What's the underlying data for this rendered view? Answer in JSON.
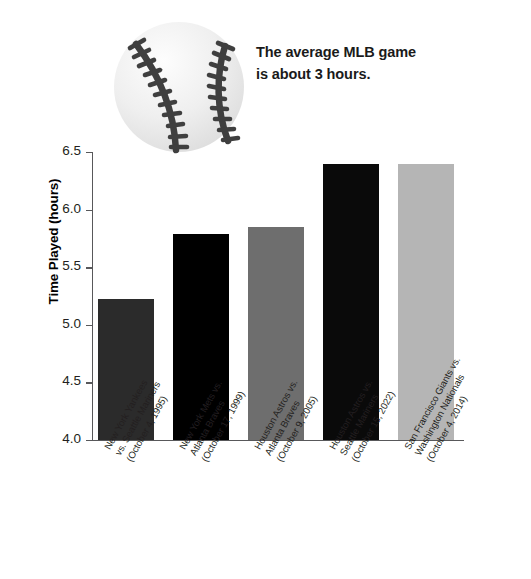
{
  "annotation": {
    "line1": "The average MLB game",
    "line2": "is about 3 hours."
  },
  "axes": {
    "y_title": "Time Played (hours)",
    "y_ticks": [
      "6.5",
      "6.0",
      "5.5",
      "5.0",
      "4.5",
      "4.0"
    ]
  },
  "icons": {
    "baseball": "baseball-icon"
  },
  "colors": {
    "bar1": "#2b2b2b",
    "bar2": "#000000",
    "bar3": "#6e6e6e",
    "bar4": "#0a0a0a",
    "bar5": "#b5b5b5",
    "axis": "#58585a",
    "baseball_body": "#ededed",
    "baseball_stitch": "#3f3f3f",
    "background": "#ffffff"
  },
  "chart_data": {
    "type": "bar",
    "title": "",
    "subtitle": "",
    "xlabel": "",
    "ylabel": "Time Played (hours)",
    "ylim": [
      4.0,
      6.5
    ],
    "ytick_step": 0.5,
    "grid": false,
    "legend": null,
    "annotations": [
      {
        "text": "The average MLB game is about 3 hours.",
        "position": "top-right"
      }
    ],
    "categories": [
      "New York Yankees vs. Seattle Mariners (October 4, 1995)",
      "New York Mets vs. Atlanta Braves (October 17, 1999)",
      "Houston Astros vs. Atlanta Braves (October 9, 2005)",
      "Houston Astros vs. Seattle Mariners (October 15, 2022)",
      "San Francisco Giants vs. Washington Nationals (October 4, 2014)"
    ],
    "values": [
      5.22,
      5.79,
      5.85,
      6.4,
      6.4
    ],
    "bar_colors": [
      "#2b2b2b",
      "#000000",
      "#6e6e6e",
      "#0a0a0a",
      "#b5b5b5"
    ]
  },
  "category_labels": [
    {
      "line1": "New York Yankees",
      "line2": "vs. Seattle Mariners",
      "line3": "(October 4, 1995)"
    },
    {
      "line1": "New York Mets vs.",
      "line2": "Atlanta Braves",
      "line3": "(October 17, 1999)"
    },
    {
      "line1": "Houston Astros vs.",
      "line2": "Atlanta Braves",
      "line3": "(October 9, 2005)"
    },
    {
      "line1": "Houston Astros vs.",
      "line2": "Seattle Mariners",
      "line3": "(October 15, 2022)"
    },
    {
      "line1": "San Francisco Giants vs.",
      "line2": "Washington Nationals",
      "line3": "(October 4, 2014)"
    }
  ]
}
